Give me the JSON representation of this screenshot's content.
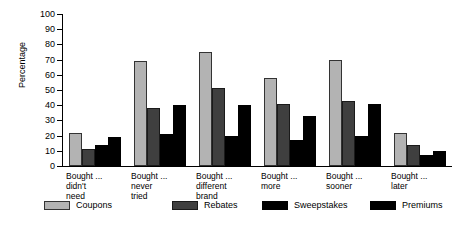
{
  "chart_data": {
    "type": "bar",
    "title": "",
    "xlabel": "",
    "ylabel": "Percentage",
    "ylim": [
      0,
      100
    ],
    "ytick_step": 10,
    "yticks": [
      0,
      10,
      20,
      30,
      40,
      50,
      60,
      70,
      80,
      90,
      100
    ],
    "grid": false,
    "legend_position": "bottom",
    "categories": [
      "Bought ...\ndidn't\nneed",
      "Bought ...\nnever\ntried",
      "Bought ...\ndifferent\nbrand",
      "Bought ...\nmore",
      "Bought ...\nsooner",
      "Bought ...\nlater"
    ],
    "series": [
      {
        "name": "Coupons",
        "color": "#b3b3b3",
        "values": [
          22,
          69,
          75,
          58,
          70,
          22
        ]
      },
      {
        "name": "Rebates",
        "color": "#3f3f3f",
        "values": [
          11,
          38,
          51,
          41,
          43,
          14
        ]
      },
      {
        "name": "Sweepstakes",
        "color": "#000000",
        "values": [
          14,
          21,
          20,
          17,
          20,
          7
        ]
      },
      {
        "name": "Premiums",
        "color": "#000000",
        "values": [
          19,
          40,
          40,
          33,
          41,
          10
        ]
      }
    ]
  },
  "legend": {
    "items": [
      {
        "label": "Coupons"
      },
      {
        "label": "Rebates"
      },
      {
        "label": "Sweepstakes"
      },
      {
        "label": "Premiums"
      }
    ]
  }
}
